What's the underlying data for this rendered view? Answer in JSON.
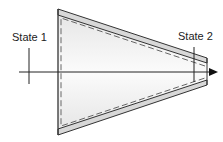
{
  "diagram": {
    "type": "converging nozzle control volume",
    "labels": {
      "state1": "State 1",
      "state2": "State 2"
    },
    "colors": {
      "wall": "#333333",
      "wall_fill": "#d8d8d8",
      "interior_fill": "#f0f0f0",
      "dashed_boundary": "#666666",
      "axis": "#222222"
    },
    "elements": [
      "nozzle-wall-top",
      "nozzle-wall-bottom",
      "inlet-face",
      "outlet-face",
      "control-volume-dashed-boundary",
      "centerline-axis-arrow",
      "state-1-marker",
      "state-2-marker"
    ]
  }
}
